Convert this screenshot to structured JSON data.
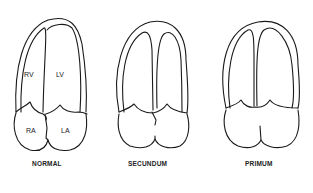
{
  "figure": {
    "panels": [
      {
        "caption": "NORMAL",
        "labels": {
          "rv": "RV",
          "lv": "LV",
          "ra": "RA",
          "la": "LA"
        }
      },
      {
        "caption": "SECUNDUM"
      },
      {
        "caption": "PRIMUM"
      }
    ]
  }
}
